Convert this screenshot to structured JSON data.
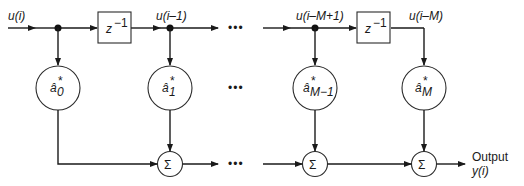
{
  "diagram": {
    "input_label": "u(i)",
    "tap_labels": [
      "u(i–1)",
      "u(i–M+1)",
      "u(i–M)"
    ],
    "delay_label": "z",
    "delay_exponent": "−1",
    "weights": [
      {
        "base": "â",
        "sub": "0",
        "sup": "*"
      },
      {
        "base": "â",
        "sub": "1",
        "sup": "*"
      },
      {
        "base": "â",
        "sub": "M−1",
        "sup": "*"
      },
      {
        "base": "â",
        "sub": "M",
        "sup": "*"
      }
    ],
    "sum_symbol": "Σ",
    "ellipsis": "•••",
    "output_label": "Output",
    "output_signal": "y(i)",
    "colors": {
      "stroke": "#1a1a1a",
      "background": "#ffffff"
    }
  }
}
